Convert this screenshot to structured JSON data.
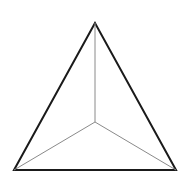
{
  "figure": {
    "type": "line-drawing",
    "canvas": {
      "width": 190,
      "height": 192,
      "background_color": "#ffffff"
    },
    "colors": {
      "outline": "#1a1a1a",
      "inner_spoke": "#8a8a8a"
    },
    "stroke_widths": {
      "outline": 2.0,
      "inner_spoke": 1.0
    },
    "vertices": {
      "apex": {
        "label": "apex",
        "x": 95,
        "y": 23
      },
      "bottom_left": {
        "label": "bottom-left",
        "x": 14,
        "y": 170
      },
      "bottom_right": {
        "label": "bottom-right",
        "x": 176,
        "y": 170
      },
      "center": {
        "label": "center-junction",
        "x": 95,
        "y": 122
      }
    },
    "outline_path": "M 95 23 L 14 170 L 176 170 Z",
    "spokes": [
      {
        "name": "spoke-to-apex",
        "from": "center",
        "to": "apex",
        "path": "M 95 122 L 95 23"
      },
      {
        "name": "spoke-to-bottom-left",
        "from": "center",
        "to": "bottom_left",
        "path": "M 95 122 L 14 170"
      },
      {
        "name": "spoke-to-bottom-right",
        "from": "center",
        "to": "bottom_right",
        "path": "M 95 122 L 176 170"
      }
    ]
  }
}
